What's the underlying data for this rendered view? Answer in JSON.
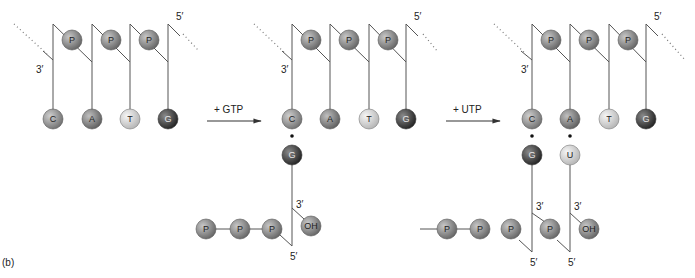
{
  "figure_label": "(b)",
  "colors": {
    "line": "#555555",
    "C": "#8f8f8f",
    "A": "#7a7a7a",
    "T": "#d6d6d6",
    "G": "#3c3c3c",
    "U": "#dcdcdc",
    "P": "#858585",
    "OH": "#8c8c8c"
  },
  "steps": [
    {
      "label": "+ GTP"
    },
    {
      "label": "+ UTP"
    }
  ],
  "panels": [
    {
      "name": "template",
      "template_bases": [
        "C",
        "A",
        "T",
        "G"
      ],
      "phosphates": [
        "P",
        "P",
        "P"
      ],
      "end_3": "3′",
      "end_5": "5′",
      "new_strand": []
    },
    {
      "name": "after-gtp",
      "template_bases": [
        "C",
        "A",
        "T",
        "G"
      ],
      "phosphates": [
        "P",
        "P",
        "P"
      ],
      "end_3": "3′",
      "end_5": "5′",
      "new_strand": [
        {
          "base": "G",
          "end_3": "3′",
          "end_5": "5′",
          "hydroxyl": "OH",
          "triphosphate": [
            "P",
            "P",
            "P"
          ]
        }
      ]
    },
    {
      "name": "after-utp",
      "template_bases": [
        "C",
        "A",
        "T",
        "G"
      ],
      "phosphates": [
        "P",
        "P",
        "P"
      ],
      "end_3": "3′",
      "end_5": "5′",
      "new_strand": [
        {
          "base": "G",
          "end_3": "3′",
          "end_5": "5′",
          "triphosphate": [
            "P",
            "P",
            "P"
          ]
        },
        {
          "base": "U",
          "end_3": "3′",
          "end_5": "5′",
          "phosphate": "P",
          "hydroxyl": "OH"
        }
      ]
    }
  ]
}
